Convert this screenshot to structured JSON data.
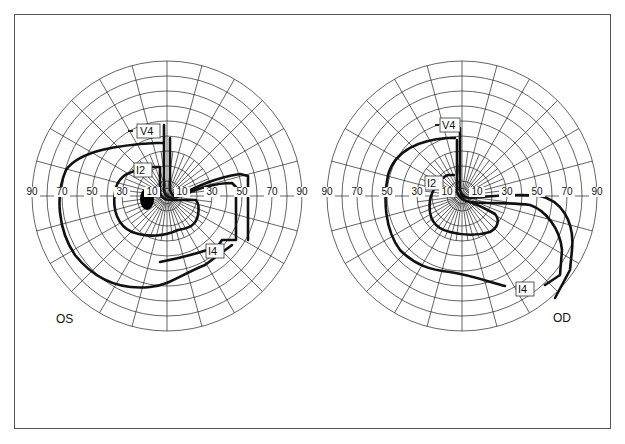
{
  "figure": {
    "type": "Goldmann visual field perimetry (kinetic)",
    "panels": [
      {
        "id": "left",
        "eye_label": "OS",
        "axis_ticks_left": [
          "90",
          "70",
          "50",
          "30",
          "10"
        ],
        "axis_ticks_right": [
          "10",
          "30",
          "50",
          "70",
          "90"
        ],
        "isopters": [
          {
            "name": "V4",
            "label": "V4"
          },
          {
            "name": "I2",
            "label": "I2"
          },
          {
            "name": "I4",
            "label": "I4"
          }
        ],
        "blind_spot": "filled ellipse left of fixation"
      },
      {
        "id": "right",
        "eye_label": "OD",
        "axis_ticks_left": [
          "90",
          "70",
          "50",
          "30",
          "10"
        ],
        "axis_ticks_right": [
          "10",
          "30",
          "50",
          "70",
          "90"
        ],
        "isopters": [
          {
            "name": "V4",
            "label": "V4"
          },
          {
            "name": "I2",
            "label": "I2"
          },
          {
            "name": "I4",
            "label": "I4"
          }
        ]
      }
    ],
    "grid": {
      "ring_step_deg": 10,
      "max_deg": 90,
      "spoke_step_deg": 15
    },
    "colors": {
      "line": "#111111",
      "grid": "#222222",
      "frame": "#555555",
      "background": "#ffffff"
    }
  }
}
